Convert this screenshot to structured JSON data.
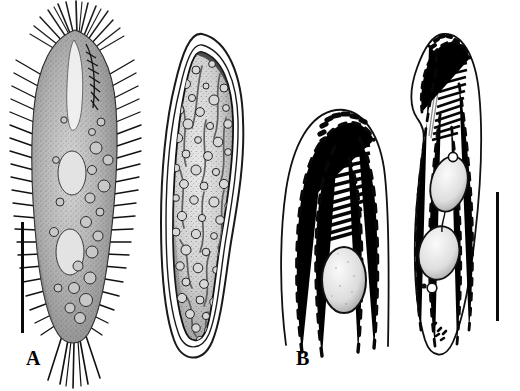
{
  "figure": {
    "background_color": "#ffffff",
    "ink_color": "#000000",
    "width": 520,
    "height": 391,
    "panel_count": 4
  },
  "panels": [
    {
      "id": "a",
      "label": "A",
      "caption": "Living specimen, ventral view, with dense cilia and bristles",
      "style": "stippled halftone drawing",
      "has_scale_bar": true,
      "features": [
        "cilia",
        "bristles",
        "macronuclear nodules",
        "cortical granules",
        "caudal cirri"
      ]
    },
    {
      "id": "b",
      "label": "B",
      "caption": "Resting cyst with thick double wall and granular contents",
      "style": "stippled halftone drawing",
      "has_scale_bar": false,
      "features": [
        "cyst wall",
        "granules",
        "internal curved strands"
      ]
    },
    {
      "id": "c",
      "label": "C",
      "caption": "Anterior portion, infraciliature, adoral zone of membranelles",
      "style": "line drawing",
      "has_scale_bar": false,
      "features": [
        "adoral zone of membranelles",
        "ciliary rows",
        "macronucleus"
      ]
    },
    {
      "id": "d",
      "label": "D",
      "caption": "Whole cell infraciliature with two macronuclear nodules",
      "style": "line drawing",
      "has_scale_bar": true,
      "features": [
        "adoral zone of membranelles",
        "ciliary rows",
        "macronuclear nodules",
        "micronucleus"
      ]
    }
  ],
  "scale_bars": [
    {
      "panel": "a",
      "orientation": "vertical",
      "x": 21,
      "y": 222,
      "length_px": 111,
      "color": "#0a0a0a"
    },
    {
      "panel": "d",
      "orientation": "vertical",
      "x": 496,
      "y": 192,
      "length_px": 129,
      "color": "#0a0a0a"
    }
  ]
}
